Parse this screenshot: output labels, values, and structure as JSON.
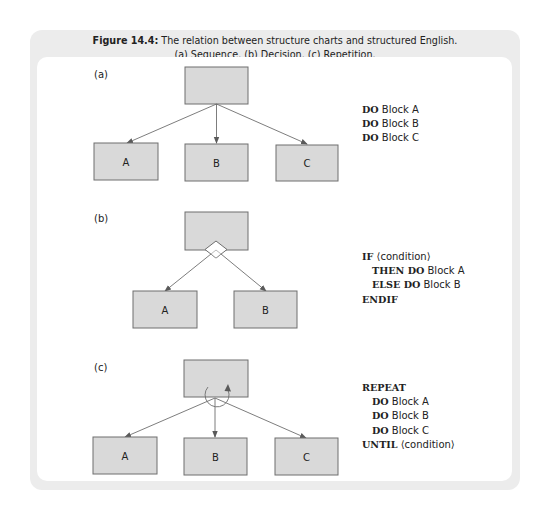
{
  "figure": {
    "number_label": "Figure 14.4:",
    "title": "The relation between structure charts and structured English.",
    "subtitle": "(a) Sequence. (b) Decision. (c) Repetition."
  },
  "panels": {
    "a": {
      "label": "(a)",
      "type": "sequence",
      "boxes": [
        "A",
        "B",
        "C"
      ],
      "code": [
        {
          "kw": "DO",
          "text": " Block A",
          "indent": false
        },
        {
          "kw": "DO",
          "text": " Block B",
          "indent": false
        },
        {
          "kw": "DO",
          "text": " Block C",
          "indent": false
        }
      ]
    },
    "b": {
      "label": "(b)",
      "type": "decision",
      "boxes": [
        "A",
        "B"
      ],
      "code": [
        {
          "kw": "IF",
          "text": " ⟨condition⟩",
          "indent": false
        },
        {
          "kw": "THEN DO",
          "text": " Block A",
          "indent": true
        },
        {
          "kw": "ELSE DO",
          "text": " Block B",
          "indent": true
        },
        {
          "kw": "ENDIF",
          "text": "",
          "indent": false
        }
      ]
    },
    "c": {
      "label": "(c)",
      "type": "repetition",
      "boxes": [
        "A",
        "B",
        "C"
      ],
      "code": [
        {
          "kw": "REPEAT",
          "text": "",
          "indent": false
        },
        {
          "kw": "DO",
          "text": " Block A",
          "indent": true
        },
        {
          "kw": "DO",
          "text": " Block B",
          "indent": true
        },
        {
          "kw": "DO",
          "text": " Block C",
          "indent": true
        },
        {
          "kw": "UNTIL",
          "text": " ⟨condition⟩",
          "indent": false
        }
      ]
    }
  },
  "colors": {
    "outer_panel": "#ececec",
    "inner_panel": "#ffffff",
    "box_fill": "#d9d9d9",
    "box_stroke": "#6e6e6e"
  }
}
